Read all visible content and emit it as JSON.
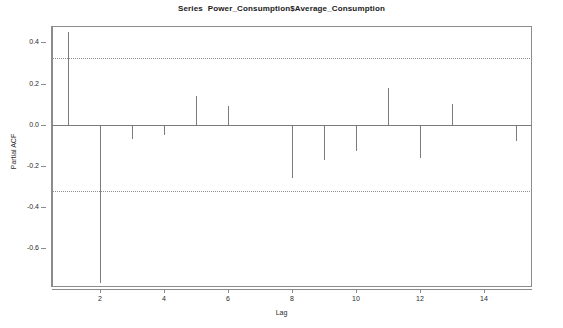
{
  "chart_data": {
    "type": "bar",
    "title": "Series  Power_Consumption$Average_Consumption",
    "xlabel": "Lag",
    "ylabel": "Partial ACF",
    "categories": [
      1,
      2,
      3,
      4,
      5,
      6,
      7,
      8,
      9,
      10,
      11,
      12,
      13,
      14,
      15
    ],
    "values": [
      0.45,
      -0.77,
      -0.07,
      -0.05,
      0.14,
      0.09,
      0.0,
      -0.26,
      -0.17,
      -0.13,
      0.18,
      -0.16,
      0.1,
      0.0,
      -0.08
    ],
    "xlim": [
      0.5,
      15.5
    ],
    "ylim": [
      -0.79,
      0.48
    ],
    "xticks": [
      2,
      4,
      6,
      8,
      10,
      12,
      14
    ],
    "xticklabels": [
      "2",
      "4",
      "6",
      "8",
      "10",
      "12",
      "14"
    ],
    "yticks": [
      0.4,
      0.2,
      0.0,
      -0.2,
      -0.4,
      -0.6
    ],
    "yticklabels": [
      "0.4",
      "0.2",
      "0.0",
      "-0.2",
      "-0.4",
      "-0.6"
    ],
    "confidence_bands": [
      0.325,
      -0.325
    ],
    "zero_line": 0.0,
    "grid": false,
    "legend": null,
    "series_color": "#7b7b7b",
    "confidence_color": "#8f8f8f",
    "axis_color": "#8c8c8c",
    "background": "#ffffff"
  }
}
